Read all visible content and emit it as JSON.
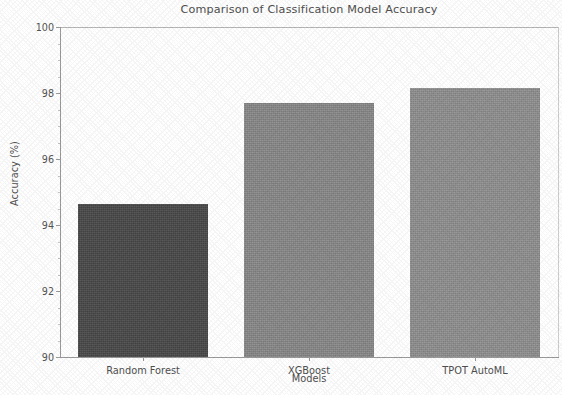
{
  "chart_data": {
    "type": "bar",
    "title": "Comparison of Classification Model Accuracy",
    "xlabel": "Models",
    "ylabel": "Accuracy (%)",
    "categories": [
      "Random Forest",
      "XGBoost",
      "TPOT AutoML"
    ],
    "values": [
      94.65,
      97.7,
      98.15
    ],
    "ylim": [
      90,
      100
    ],
    "yticks": [
      90,
      92,
      94,
      96,
      98,
      100
    ],
    "ytick_labels": [
      "90",
      "92",
      "94",
      "96",
      "98",
      "100"
    ],
    "grid": false,
    "legend": null,
    "bar_colors": [
      "#4a4a4a",
      "#8a8a8a",
      "#919191"
    ],
    "series": [
      {
        "name": "Accuracy",
        "values": [
          94.65,
          97.7,
          98.15
        ]
      }
    ]
  },
  "figure": {
    "background_color": "#ffffff",
    "axis_color": "#9a9a9a",
    "text_color": "#4f4f4f"
  }
}
